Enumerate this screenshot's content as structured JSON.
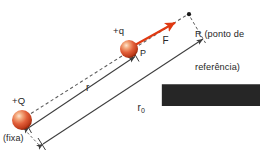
{
  "figure": {
    "background_color": "#ffffff",
    "width": 260,
    "height": 156
  },
  "colors": {
    "sphere_core": "#f6b78e",
    "sphere_mid": "#e2603a",
    "sphere_edge": "#a32a11",
    "force_arrow": "#e03a12",
    "line": "#3d3d3d",
    "text": "#262626",
    "dashed": "#5a5a5a"
  },
  "labels": {
    "source_charge": "+Q",
    "source_note": "(fixa)",
    "test_charge": "+q",
    "point_p": "P",
    "force_vector": "F",
    "reference_point_line1": "R (ponto de",
    "reference_point_line2": "referência)",
    "distance_r": "r",
    "distance_r0_base": "r",
    "distance_r0_sub": "0"
  },
  "elements": {
    "charge_Q": {
      "name": "fixed-source-charge",
      "cx": 22,
      "cy": 120,
      "r": 10
    },
    "charge_q": {
      "name": "mobile-test-charge",
      "cx": 129,
      "cy": 49,
      "r": 9
    },
    "point_R": {
      "name": "reference-point-dot",
      "cx": 189,
      "cy": 14,
      "r": 2
    },
    "force_arrow": {
      "from_x": 136,
      "from_y": 44,
      "to_x": 176,
      "to_y": 22
    },
    "r_measure": {
      "from_x": 27,
      "from_y": 128,
      "to_x": 136,
      "to_y": 56
    },
    "r0_measure": {
      "from_x": 41,
      "from_y": 145,
      "to_x": 204,
      "to_y": 38
    },
    "dashed_axis": {
      "from_x": 30,
      "from_y": 114,
      "to_x": 186,
      "to_y": 16
    }
  }
}
